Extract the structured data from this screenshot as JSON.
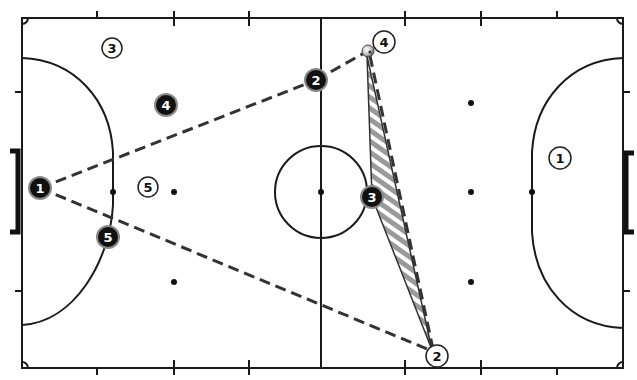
{
  "diagram": {
    "top_caption_partial": "",
    "court": {
      "bounds": {
        "left": 22,
        "right": 623,
        "top": 18,
        "bottom": 368
      },
      "center_x": 321,
      "center_circle": {
        "cx": 321,
        "cy": 192,
        "r": 46
      },
      "colors": {
        "lines": "#1a1a1a",
        "background": "#ffffff",
        "shading": "#9a9a9a"
      }
    },
    "marks": {
      "spots": [
        [
          113,
          192
        ],
        [
          174,
          192
        ],
        [
          174,
          282
        ],
        [
          321,
          192
        ],
        [
          471,
          103
        ],
        [
          471,
          192
        ],
        [
          471,
          282
        ],
        [
          532,
          192
        ]
      ]
    },
    "ball": {
      "x": 368,
      "y": 50,
      "label": "ball"
    },
    "team_dark": {
      "name": "Attacking team (dark)",
      "players": [
        {
          "number": "1",
          "x": 40,
          "y": 188
        },
        {
          "number": "5",
          "x": 108,
          "y": 237
        },
        {
          "number": "4",
          "x": 166,
          "y": 105
        },
        {
          "number": "2",
          "x": 316,
          "y": 80
        },
        {
          "number": "3",
          "x": 372,
          "y": 197
        }
      ]
    },
    "team_light": {
      "name": "Defending team (white)",
      "players": [
        {
          "number": "3",
          "x": 112,
          "y": 48
        },
        {
          "number": "5",
          "x": 148,
          "y": 187
        },
        {
          "number": "4",
          "x": 384,
          "y": 42
        },
        {
          "number": "1",
          "x": 560,
          "y": 158
        },
        {
          "number": "2",
          "x": 437,
          "y": 356
        }
      ]
    },
    "passing_lines": [
      {
        "from": "dark-1",
        "to": "dark-2",
        "style": "dashed"
      },
      {
        "from": "dark-2",
        "to": "ball",
        "style": "dashed"
      },
      {
        "from": "dark-1",
        "to": "light-2",
        "style": "dashed"
      },
      {
        "from": "ball",
        "to": "light-2",
        "style": "dashed"
      }
    ],
    "shaded_area": {
      "points": [
        [
          368,
          50
        ],
        [
          372,
          197
        ],
        [
          432,
          350
        ]
      ],
      "pattern": "diagonal gray stripes"
    }
  }
}
